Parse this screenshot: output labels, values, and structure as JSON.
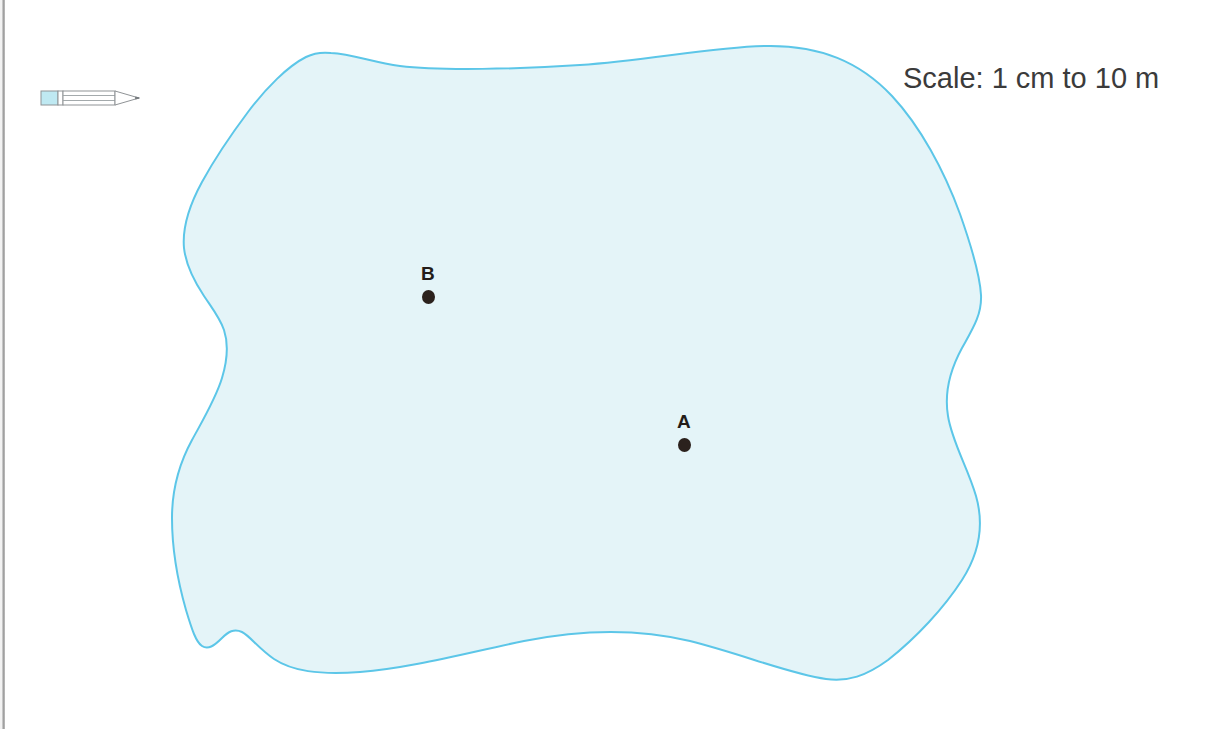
{
  "page": {
    "background_color": "#ffffff"
  },
  "toolbar": {
    "pencil_icon_name": "pencil-icon",
    "pencil_body_color": "#ffffff",
    "pencil_eraser_color": "#bfe9f2",
    "pencil_outline_color": "#8f9396"
  },
  "scale": {
    "text": "Scale: 1 cm to 10 m",
    "color": "#3b3b3b"
  },
  "lake": {
    "name": "lake-shape",
    "fill_color": "#e4f4f8",
    "stroke_color": "#5cc6e8",
    "stroke_width": 2
  },
  "markers": [
    {
      "id": "B",
      "label": "B",
      "x": 428,
      "y": 305,
      "label_x": 428,
      "label_y": 270,
      "dot_color": "#2b211d"
    },
    {
      "id": "A",
      "label": "A",
      "x": 684,
      "y": 453,
      "label_x": 684,
      "label_y": 418,
      "dot_color": "#2b211d"
    }
  ],
  "artifacts": {
    "left_scan_edge_color": "#8c8c8c"
  }
}
